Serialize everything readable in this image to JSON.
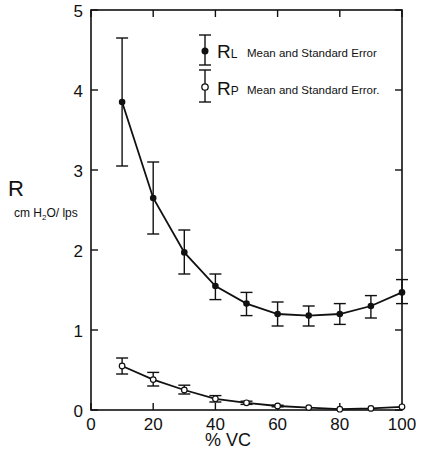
{
  "chart_data": {
    "type": "line",
    "title": "",
    "xlabel": "% VC",
    "ylabel": "R",
    "ylabel_units": "cmH2O/lps",
    "xlim": [
      0,
      100
    ],
    "ylim": [
      0,
      5
    ],
    "x_ticks": [
      0,
      20,
      40,
      60,
      80,
      100
    ],
    "y_ticks": [
      0,
      1,
      2,
      3,
      4,
      5
    ],
    "grid": false,
    "legend_position": "upper right",
    "x": [
      10,
      20,
      30,
      40,
      50,
      60,
      70,
      80,
      90,
      100
    ],
    "series": [
      {
        "name": "RL Mean and Standard Error",
        "symbol": "L",
        "marker": "filled-circle",
        "values": [
          3.85,
          2.65,
          1.97,
          1.55,
          1.33,
          1.2,
          1.18,
          1.2,
          1.3,
          1.47
        ],
        "err_low": [
          3.05,
          2.2,
          1.7,
          1.38,
          1.18,
          1.05,
          1.05,
          1.07,
          1.15,
          1.33
        ],
        "err_high": [
          4.65,
          3.1,
          2.25,
          1.7,
          1.47,
          1.35,
          1.3,
          1.33,
          1.43,
          1.63
        ]
      },
      {
        "name": "RP Mean and Standard Error",
        "symbol": "P",
        "marker": "open-circle",
        "values": [
          0.55,
          0.38,
          0.25,
          0.14,
          0.09,
          0.05,
          0.03,
          0.01,
          0.02,
          0.04
        ],
        "err_low": [
          0.45,
          0.3,
          0.2,
          0.1,
          0.07,
          0.04,
          0.03,
          0.01,
          0.02,
          0.04
        ],
        "err_high": [
          0.65,
          0.47,
          0.31,
          0.18,
          0.11,
          0.06,
          0.03,
          0.01,
          0.02,
          0.04
        ]
      }
    ]
  },
  "labels": {
    "y_main": "R",
    "y_units_pre": "cm H",
    "y_units_sub": "2",
    "y_units_post": "O/ lps",
    "x_axis": "% VC",
    "legend_rl_letter": "R",
    "legend_rl_sub": "L",
    "legend_rl_text": "Mean and Standard Error",
    "legend_rp_letter": "R",
    "legend_rp_sub": "P",
    "legend_rp_text": "Mean and Standard Error."
  }
}
